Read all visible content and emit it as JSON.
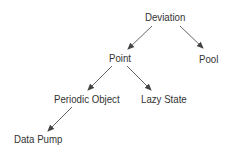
{
  "diagram": {
    "type": "tree",
    "nodes": [
      {
        "id": "deviation",
        "label": "Deviation"
      },
      {
        "id": "point",
        "label": "Point"
      },
      {
        "id": "pool",
        "label": "Pool"
      },
      {
        "id": "periodic_object",
        "label": "Periodic Object"
      },
      {
        "id": "lazy_state",
        "label": "Lazy State"
      },
      {
        "id": "data_pump",
        "label": "Data Pump"
      }
    ],
    "edges": [
      {
        "from": "deviation",
        "to": "point"
      },
      {
        "from": "deviation",
        "to": "pool"
      },
      {
        "from": "point",
        "to": "periodic_object"
      },
      {
        "from": "point",
        "to": "lazy_state"
      },
      {
        "from": "periodic_object",
        "to": "data_pump"
      }
    ],
    "colors": {
      "text": "#333333",
      "edge": "#555555",
      "background": "#ffffff"
    }
  }
}
